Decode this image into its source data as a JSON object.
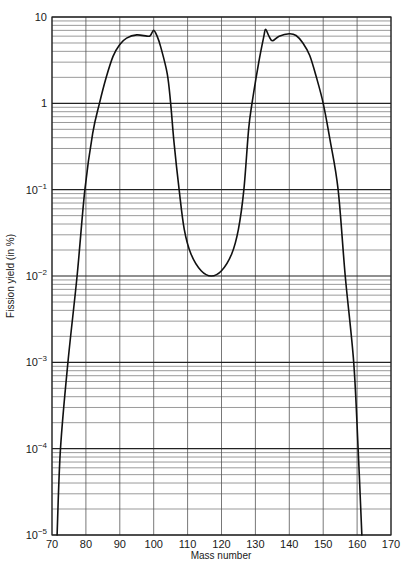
{
  "chart_data": {
    "type": "line",
    "title": "",
    "xlabel": "Mass number",
    "ylabel": "Fission yield (in %)",
    "xlim": [
      70,
      170
    ],
    "ylim": [
      1e-05,
      10
    ],
    "yscale": "log",
    "grid": true,
    "legend": null,
    "x_ticks": [
      70,
      80,
      90,
      100,
      110,
      120,
      130,
      140,
      150,
      160,
      170
    ],
    "x_tick_labels": [
      "70",
      "80",
      "90",
      "100",
      "110",
      "120",
      "130",
      "140",
      "150",
      "160",
      "170"
    ],
    "y_ticks": [
      10,
      1,
      0.1,
      0.01,
      0.001,
      0.0001,
      1e-05
    ],
    "y_tick_labels": [
      {
        "base": "10",
        "exp": ""
      },
      {
        "base": "1",
        "exp": ""
      },
      {
        "base": "10",
        "exp": "−1"
      },
      {
        "base": "10",
        "exp": "−2"
      },
      {
        "base": "10",
        "exp": "−3"
      },
      {
        "base": "10",
        "exp": "−4"
      },
      {
        "base": "10",
        "exp": "−5"
      }
    ],
    "series": [
      {
        "name": "Fission yield curve",
        "x": [
          71.5,
          72.5,
          74.7,
          77.4,
          79.7,
          82,
          84,
          86,
          88,
          90,
          92,
          95,
          98,
          99,
          100,
          101,
          102,
          104,
          105,
          106,
          107.5,
          109,
          111,
          114,
          117,
          120,
          123,
          125,
          126.6,
          128,
          129,
          131,
          132.5,
          133,
          134,
          135,
          137,
          140,
          142,
          144,
          146,
          148,
          150,
          152,
          154.4,
          156.5,
          159,
          160.3,
          161.4
        ],
        "y": [
          1e-05,
          0.0001,
          0.001,
          0.01,
          0.1,
          0.45,
          1.0,
          2.0,
          3.5,
          4.8,
          5.7,
          6.2,
          6.0,
          6.1,
          7.0,
          6.0,
          4.6,
          2.2,
          1.0,
          0.35,
          0.1,
          0.035,
          0.018,
          0.0115,
          0.01,
          0.0115,
          0.018,
          0.035,
          0.1,
          0.5,
          1.0,
          3.0,
          6.0,
          7.2,
          6.0,
          5.3,
          6.0,
          6.4,
          6.1,
          5.0,
          3.6,
          2.0,
          1.0,
          0.38,
          0.1,
          0.01,
          0.001,
          0.0001,
          1e-05
        ]
      }
    ]
  },
  "page": {
    "header_text": "",
    "page_number": ""
  }
}
